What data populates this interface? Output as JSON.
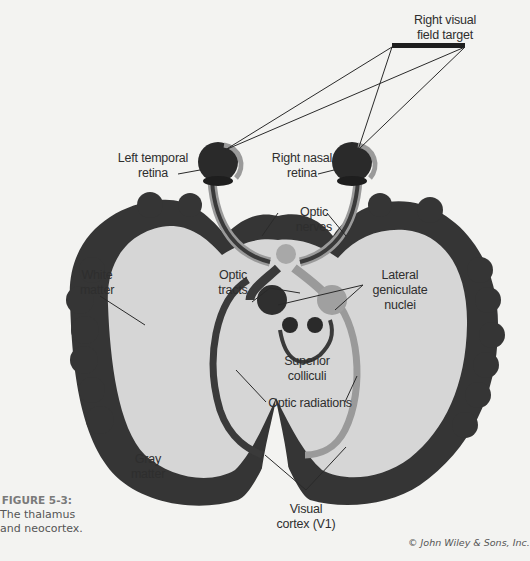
{
  "figure": {
    "number": "FIGURE 5-3:",
    "caption_line1": "The thalamus",
    "caption_line2": "and neocortex.",
    "credit": "© John Wiley & Sons, Inc."
  },
  "labels": {
    "right_visual_field_target": [
      "Right visual",
      "field target"
    ],
    "left_temporal_retina": [
      "Left temporal",
      "retina"
    ],
    "right_nasal_retina": [
      "Right nasal",
      "retina"
    ],
    "optic_nerves": [
      "Optic",
      "nerves"
    ],
    "white_matter": [
      "White",
      "matter"
    ],
    "optic_tracts": [
      "Optic",
      "tracts"
    ],
    "lateral_geniculate_nuclei": [
      "Lateral",
      "geniculate",
      "nuclei"
    ],
    "superior_colliculi": [
      "Superior",
      "colliculi"
    ],
    "optic_radiations": [
      "Optic radiations"
    ],
    "gray_matter": [
      "Gray",
      "matter"
    ],
    "visual_cortex": [
      "Visual",
      "cortex (V1)"
    ]
  },
  "colors": {
    "background": "#f3f3f1",
    "gray_matter": "#353535",
    "white_matter": "#d6d6d6",
    "left_pathway": "#3a3a3a",
    "right_pathway": "#9a9a9a",
    "leader_lines": "#2a2a2a"
  }
}
